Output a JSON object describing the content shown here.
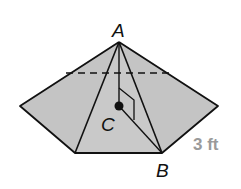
{
  "figure": {
    "type": "pentagonal pyramid",
    "labels": {
      "apex": "A",
      "center": "C",
      "base_vertex": "B"
    },
    "dimension_label": "3 ft",
    "colors": {
      "fill": "#c4c4c4",
      "stroke": "#111111",
      "dimension_text": "#9a9a9a"
    }
  }
}
